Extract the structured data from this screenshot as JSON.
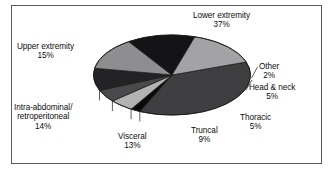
{
  "figure": {
    "background_color": "#ffffff",
    "frame_color": "#59595b"
  },
  "chart_data": {
    "type": "pie",
    "title": "",
    "subtitle": "",
    "xlabel": "",
    "ylabel": "",
    "legend_position": "none",
    "grid": false,
    "three_d": true,
    "units": "percent",
    "total": 100,
    "start_angle_deg": 341,
    "direction": "clockwise",
    "categories": [
      "Lower extremity",
      "Other",
      "Head & neck",
      "Thoracic",
      "Truncal",
      "Visceral",
      "Intra-abdominal/retroperitoneal",
      "Upper extremity"
    ],
    "values": [
      37,
      2,
      5,
      5,
      9,
      13,
      14,
      15
    ],
    "slices": [
      {
        "name": "Lower extremity",
        "label_line1": "Lower extremity",
        "label_line2": "37%",
        "value": 37,
        "percent_text": "37%",
        "color": "#3f3f41",
        "side_color": "#f2f2f2",
        "leader_line": false
      },
      {
        "name": "Other",
        "label_line1": "Other",
        "label_line2": "2%",
        "value": 2,
        "percent_text": "2%",
        "color": "#0a0a0a",
        "side_color": "#f2f2f2",
        "leader_line": true
      },
      {
        "name": "Head & neck",
        "label_line1": "Head & neck",
        "label_line2": "5%",
        "value": 5,
        "percent_text": "5%",
        "color": "#b2b2b2",
        "side_color": "#f2f2f2",
        "leader_line": true
      },
      {
        "name": "Thoracic",
        "label_line1": "Thoracic",
        "label_line2": "5%",
        "value": 5,
        "percent_text": "5%",
        "color": "#4a4a4c",
        "side_color": "#f2f2f2",
        "leader_line": false
      },
      {
        "name": "Truncal",
        "label_line1": "Truncal",
        "label_line2": "9%",
        "value": 9,
        "percent_text": "9%",
        "color": "#232325",
        "side_color": "#f2f2f2",
        "leader_line": false
      },
      {
        "name": "Visceral",
        "label_line1": "Visceral",
        "label_line2": "13%",
        "value": 13,
        "percent_text": "13%",
        "color": "#8e8e90",
        "side_color": "#f2f2f2",
        "leader_line": false
      },
      {
        "name": "Intra-abdominal/retroperitoneal",
        "label_line1": "Intra-abdominal/",
        "label_line2": "retroperitoneal",
        "label_line3": "14%",
        "value": 14,
        "percent_text": "14%",
        "color": "#141416",
        "side_color": "#f2f2f2",
        "leader_line": false
      },
      {
        "name": "Upper extremity",
        "label_line1": "Upper extremity",
        "label_line2": "15%",
        "value": 15,
        "percent_text": "15%",
        "color": "#a3a3a5",
        "side_color": "#f2f2f2",
        "leader_line": false
      }
    ]
  }
}
